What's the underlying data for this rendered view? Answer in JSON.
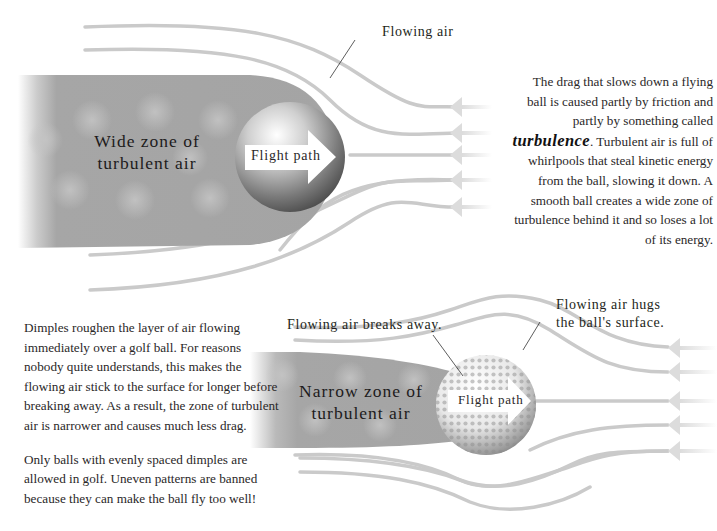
{
  "top_diagram": {
    "zone_label_line1": "Wide zone of",
    "zone_label_line2": "turbulent air",
    "arrow_label": "Flight path",
    "callout": "Flowing air",
    "ball_type": "smooth ball"
  },
  "top_paragraph": {
    "before": "The drag that slows down a flying ball is caused partly by friction and partly by something called ",
    "emphasis": "turbulence",
    "after": ". Turbulent air is full of whirlpools that steal kinetic energy from the ball, slowing it down. A smooth ball creates a wide zone of turbulence behind it and so loses a lot of its energy."
  },
  "bottom_diagram": {
    "zone_label_line1": "Narrow zone of",
    "zone_label_line2": "turbulent air",
    "arrow_label": "Flight path",
    "callout_left": "Flowing air breaks away.",
    "callout_right_line1": "Flowing air hugs",
    "callout_right_line2": "the ball's surface.",
    "ball_type": "dimpled golf ball"
  },
  "bottom_paragraphs": [
    "Dimples roughen the layer of air flowing immediately over a golf ball. For reasons nobody quite understands, this makes the flowing air stick to the surface for longer before breaking away. As a result, the zone of turbulent air is narrower and causes much less drag.",
    "Only balls with evenly spaced dimples are allowed in golf. Uneven patterns are banned because they can make the ball fly too well!"
  ],
  "colors": {
    "background": "#ffffff",
    "turbulence_zone": "#a9a9a9",
    "flow_line": "#c8c8c8",
    "text": "#231f20"
  }
}
